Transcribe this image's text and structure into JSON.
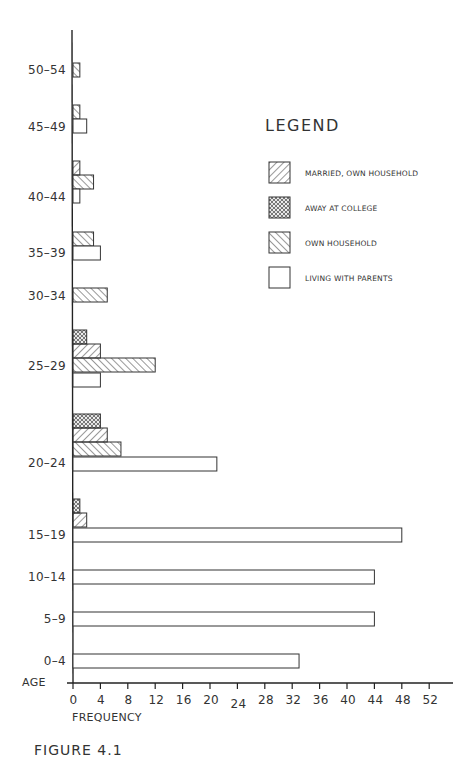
{
  "chart_data": {
    "type": "bar",
    "orientation": "horizontal",
    "title": "",
    "xlabel": "FREQUENCY",
    "ylabel": "AGE",
    "xlim": [
      0,
      52
    ],
    "x_ticks": [
      0,
      4,
      8,
      12,
      16,
      20,
      24,
      28,
      32,
      36,
      40,
      44,
      48,
      52
    ],
    "grid": false,
    "legend_position": "upper right",
    "legend_title": "LEGEND",
    "categories": [
      "50-54",
      "45-49",
      "40-44",
      "35-39",
      "30-34",
      "25-29",
      "20-24",
      "15-19",
      "10-14",
      "5-9",
      "0-4"
    ],
    "series": [
      {
        "name": "MARRIED, OWN HOUSEHOLD",
        "pattern": "diagonal-forward",
        "values": [
          0,
          0,
          1,
          0,
          0,
          4,
          5,
          2,
          0,
          0,
          0
        ]
      },
      {
        "name": "AWAY AT COLLEGE",
        "pattern": "crosshatch",
        "values": [
          0,
          0,
          0,
          0,
          0,
          2,
          4,
          1,
          0,
          0,
          0
        ]
      },
      {
        "name": "OWN HOUSEHOLD",
        "pattern": "diagonal-backward",
        "values": [
          1,
          1,
          3,
          3,
          5,
          12,
          7,
          0,
          0,
          0,
          0
        ]
      },
      {
        "name": "LIVING WITH PARENTS",
        "pattern": "none",
        "values": [
          0,
          2,
          1,
          4,
          0,
          4,
          21,
          48,
          44,
          44,
          33
        ]
      }
    ]
  },
  "axis": {
    "y_title": "AGE",
    "x_title": "FREQUENCY",
    "x_ticks": [
      "0",
      "4",
      "8",
      "12",
      "16",
      "20",
      "24",
      "28",
      "32",
      "36",
      "40",
      "44",
      "48",
      "52"
    ],
    "y_labels": [
      "50–54",
      "45–49",
      "40–44",
      "35–39",
      "30–34",
      "25–29",
      "20–24",
      "15–19",
      "10–14",
      "5–9",
      "0–4"
    ]
  },
  "legend": {
    "title": "LEGEND",
    "items": [
      {
        "label": "MARRIED, OWN HOUSEHOLD",
        "pattern": "diag-fwd"
      },
      {
        "label": "AWAY AT COLLEGE",
        "pattern": "cross"
      },
      {
        "label": "OWN HOUSEHOLD",
        "pattern": "diag-back"
      },
      {
        "label": "LIVING WITH PARENTS",
        "pattern": "none"
      }
    ]
  },
  "caption": "FIGURE 4.1",
  "colors": {
    "ink": "#333333",
    "background": "#ffffff"
  }
}
